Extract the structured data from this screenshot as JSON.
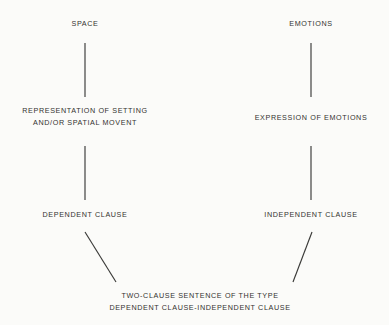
{
  "diagram": {
    "background_color": "#fbfbf9",
    "text_color": "#33322f",
    "connector_color": "#3a3a38",
    "nodes": {
      "space": {
        "lines": [
          "SPACE"
        ]
      },
      "emotions": {
        "lines": [
          "EMOTIONS"
        ]
      },
      "representation": {
        "lines": [
          "REPRESENTATION OF SETTING",
          "AND/OR SPATIAL MOVENT"
        ]
      },
      "expression": {
        "lines": [
          "EXPRESSION OF EMOTIONS"
        ]
      },
      "dependent_clause": {
        "lines": [
          "DEPENDENT CLAUSE"
        ]
      },
      "independent_clause": {
        "lines": [
          "INDEPENDENT CLAUSE"
        ]
      },
      "two_clause_sentence": {
        "lines": [
          "TWO-CLAUSE SENTENCE OF THE TYPE",
          "DEPENDENT CLAUSE-INDEPENDENT CLAUSE"
        ]
      }
    },
    "connectors": [
      {
        "name": "space-to-representation",
        "kind": "vertical",
        "x1": 85,
        "y1": 43,
        "x2": 85,
        "y2": 97
      },
      {
        "name": "emotions-to-expression",
        "kind": "vertical",
        "x1": 311,
        "y1": 43,
        "x2": 311,
        "y2": 97
      },
      {
        "name": "representation-to-dependent",
        "kind": "vertical",
        "x1": 85,
        "y1": 146,
        "x2": 85,
        "y2": 200
      },
      {
        "name": "expression-to-independent",
        "kind": "vertical",
        "x1": 311,
        "y1": 146,
        "x2": 311,
        "y2": 200
      },
      {
        "name": "dependent-to-two-clause",
        "kind": "diagonal",
        "x1": 85,
        "y1": 232,
        "x2": 116,
        "y2": 282
      },
      {
        "name": "independent-to-two-clause",
        "kind": "diagonal",
        "x1": 312,
        "y1": 232,
        "x2": 293,
        "y2": 282
      }
    ]
  }
}
